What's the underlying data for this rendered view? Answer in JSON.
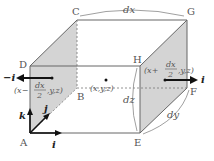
{
  "vertices": {
    "A": "A",
    "B": "B",
    "C": "C",
    "D": "D",
    "E": "E",
    "F": "F",
    "G": "G",
    "H": "H"
  },
  "dimensions": {
    "dx": "dx",
    "dy": "dy",
    "dz": "dz"
  },
  "center_point": "(x,y,z)",
  "left_face_point": {
    "prefix": "(x−",
    "num": "dx",
    "den": "2",
    "suffix": ",y,z)"
  },
  "right_face_point": {
    "prefix": "(x+",
    "num": "dx",
    "den": "2",
    "suffix": ",y,z)"
  },
  "vectors": {
    "left_normal": "−i",
    "right_normal": "i",
    "axis_i": "i",
    "axis_j": "j",
    "axis_k": "k"
  },
  "colors": {
    "face_fill": "#d4d4d4",
    "edge": "#555555",
    "arrow": "#111111"
  }
}
